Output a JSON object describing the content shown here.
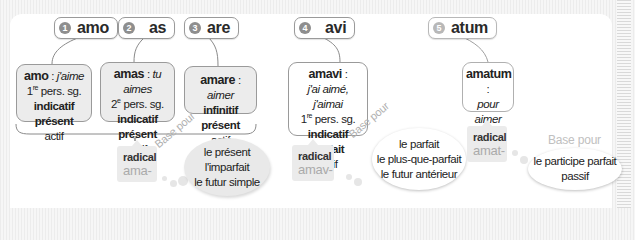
{
  "forms": [
    {
      "index": "1",
      "word": "amo"
    },
    {
      "index": "2",
      "word": "as"
    },
    {
      "index": "3",
      "word": "are"
    },
    {
      "index": "4",
      "word": "avi"
    },
    {
      "index": "5",
      "word": "atum"
    }
  ],
  "cards": {
    "amo": {
      "head": "amo",
      "sep": " : ",
      "translation": "j'aime",
      "person_num": "1",
      "person_sup": "re",
      "person_rest": " pers. sg.",
      "mood": "indicatif présent",
      "voice": "actif"
    },
    "amas": {
      "head": "amas",
      "sep": " : ",
      "translation": "tu aimes",
      "person_num": "2",
      "person_sup": "e",
      "person_rest": " pers. sg.",
      "mood": "indicatif présent",
      "voice": "actif"
    },
    "amare": {
      "head": "amare",
      "sep": " : ",
      "translation": "aimer",
      "mood": "infinitif présent",
      "voice": "actif"
    },
    "amavi": {
      "head": "amavi",
      "sep": " :",
      "translation": "j'ai aimé, j'aimai",
      "person_num": "1",
      "person_sup": "re",
      "person_rest": " pers. sg.",
      "mood": "indicatif parfait",
      "voice": "actif"
    },
    "amatum": {
      "head": "amatum",
      "sep": " :",
      "translation": "pour aimer",
      "mood": "supin"
    }
  },
  "radicals": [
    {
      "label": "radical",
      "stem": "ama-",
      "base_label": "Base pour",
      "uses": [
        "le présent",
        "l'imparfait",
        "le futur simple"
      ]
    },
    {
      "label": "radical",
      "stem": "amav-",
      "base_label": "Base pour",
      "uses": [
        "le parfait",
        "le plus-que-parfait",
        "le futur antérieur"
      ]
    },
    {
      "label": "radical",
      "stem": "amat-",
      "base_label": "Base pour",
      "uses": [
        "le participe parfait",
        "passif"
      ]
    }
  ],
  "colors": {
    "card_fill": "#ececec",
    "border": "#9a9a9a",
    "stem_text": "#aaaaaa",
    "base_pour_text": "#b0b0b0"
  }
}
